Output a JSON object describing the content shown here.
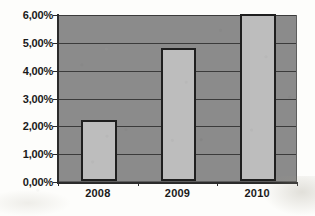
{
  "chart_data": {
    "type": "bar",
    "title": "",
    "subtitle": "",
    "xlabel": "",
    "ylabel": "",
    "categories": [
      "2008",
      "2009",
      "2010"
    ],
    "values": [
      2.2,
      4.78,
      6.0
    ],
    "value_labels": [
      "2,20%",
      "4,78%",
      "6,00%"
    ],
    "ylim": [
      0,
      6
    ],
    "ytick_values": [
      0,
      1,
      2,
      3,
      4,
      5,
      6
    ],
    "ytick_labels": [
      "0,00%",
      "1,00%",
      "2,00%",
      "3,00%",
      "4,00%",
      "5,00%",
      "6,00%"
    ],
    "grid": true,
    "legend": false,
    "legend_position": "none",
    "decimal_separator": ",",
    "series": [
      {
        "name": "",
        "values": [
          2.2,
          4.78,
          6.0
        ]
      }
    ],
    "colors": {
      "bar_fill": "#bdbdbd",
      "bar_border": "#1f1f1f",
      "plot_background": "#8b8b8b",
      "gridline": "#3b3b3b",
      "axis": "#2b2b2b",
      "tick_label": "#1a1a1a",
      "page_background": "#fdfdfb"
    }
  }
}
